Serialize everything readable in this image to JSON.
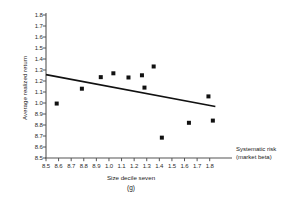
{
  "chart_data": {
    "type": "scatter",
    "title": "",
    "subtitle": "",
    "panel_label": "(g)",
    "xlabel": "Size decile seven",
    "ylabel": "Average realized return",
    "x_axis_title_line1": "Systematic risk",
    "x_axis_title_line2": "(market beta)",
    "xlim": [
      0.5,
      1.85
    ],
    "ylim": [
      0.5,
      1.8
    ],
    "grid": false,
    "legend": "none",
    "xticks": [
      0.5,
      0.6,
      0.7,
      0.8,
      0.9,
      1.0,
      1.1,
      1.2,
      1.3,
      1.4,
      1.5,
      1.6,
      1.7,
      1.8
    ],
    "xtick_labels": [
      "8.5",
      "8.6",
      "8.7",
      "8.8",
      "8.9",
      "1.0",
      "1.1",
      "1.2",
      "1.3",
      "1.4",
      "1.5",
      "1.6",
      "1.7",
      "1.8"
    ],
    "yticks": [
      0.5,
      0.6,
      0.7,
      0.8,
      0.9,
      1.0,
      1.1,
      1.2,
      1.3,
      1.4,
      1.5,
      1.6,
      1.7,
      1.8
    ],
    "ytick_labels": [
      "8.5",
      "8.6",
      "8.7",
      "8.8",
      "8.9",
      "1.0",
      "1.1",
      "1.2",
      "1.3",
      "1.4",
      "1.5",
      "1.6",
      "1.7",
      "1.8"
    ],
    "marker": {
      "shape": "square",
      "color": "#111111",
      "size_px": 4
    },
    "series": [
      {
        "name": "Portfolio observations",
        "points": [
          {
            "x": 0.585,
            "y": 0.995
          },
          {
            "x": 0.785,
            "y": 1.13
          },
          {
            "x": 0.935,
            "y": 1.235
          },
          {
            "x": 1.035,
            "y": 1.27
          },
          {
            "x": 1.155,
            "y": 1.232
          },
          {
            "x": 1.262,
            "y": 1.252
          },
          {
            "x": 1.282,
            "y": 1.14
          },
          {
            "x": 1.355,
            "y": 1.332
          },
          {
            "x": 1.42,
            "y": 0.685
          },
          {
            "x": 1.635,
            "y": 0.82
          },
          {
            "x": 1.79,
            "y": 1.06
          },
          {
            "x": 1.825,
            "y": 0.84
          }
        ]
      }
    ],
    "fit_line": {
      "name": "Fitted regression line",
      "x0": 0.5,
      "y0": 1.258,
      "x1": 1.845,
      "y1": 0.968,
      "color": "#111111",
      "width_px": 1.6
    },
    "axis_color": "#555555"
  }
}
